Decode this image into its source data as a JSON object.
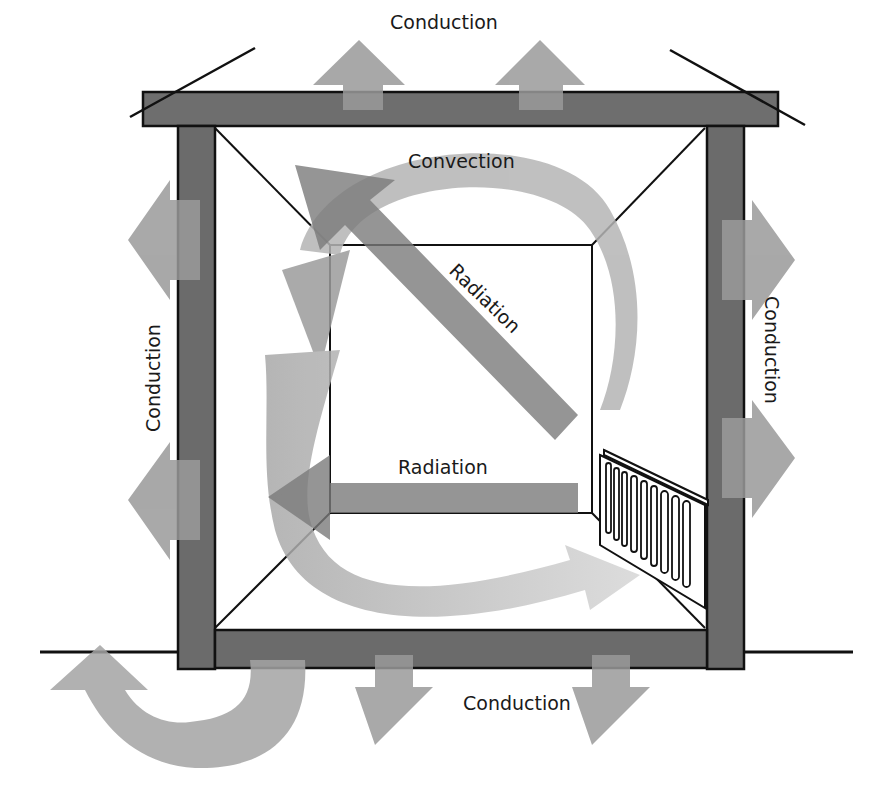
{
  "diagram": {
    "labels": {
      "conduction_top": "Conduction",
      "conduction_left": "Conduction",
      "conduction_right": "Conduction",
      "conduction_bottom": "Conduction",
      "convection": "Convection",
      "radiation_diagonal": "Radiation",
      "radiation_horizontal": "Radiation"
    },
    "colors": {
      "wall": "#6b6b6b",
      "arrow": "#9a9a9a",
      "arrow_dark": "#7d7d7d",
      "convection": "#b3b3b3",
      "outline": "#111111",
      "background": "#ffffff"
    },
    "elements": [
      "roof",
      "left-wall",
      "right-wall",
      "floor",
      "ground-line",
      "radiator"
    ]
  }
}
